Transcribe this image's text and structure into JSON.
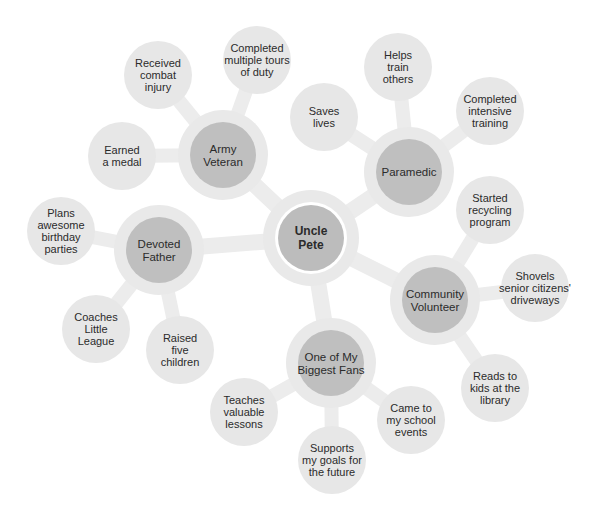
{
  "colors": {
    "connector": "#ececec",
    "halo": "#e9e9e9",
    "leaf": "#e7e7e7",
    "category": "#bfbfbf",
    "center": "#bcbcbc",
    "center_ring": "#ffffff",
    "text": "#2b2b2b"
  },
  "center": {
    "label": [
      "Uncle",
      "Pete"
    ]
  },
  "categories": [
    {
      "id": "army-veteran",
      "label": [
        "Army",
        "Veteran"
      ],
      "leaves": [
        {
          "label": [
            "Received",
            "combat",
            "injury"
          ]
        },
        {
          "label": [
            "Completed",
            "multiple tours",
            "of duty"
          ]
        },
        {
          "label": [
            "Earned",
            "a medal"
          ]
        }
      ]
    },
    {
      "id": "paramedic",
      "label": [
        "Paramedic"
      ],
      "leaves": [
        {
          "label": [
            "Saves",
            "lives"
          ]
        },
        {
          "label": [
            "Helps",
            "train",
            "others"
          ]
        },
        {
          "label": [
            "Completed",
            "intensive",
            "training"
          ]
        }
      ]
    },
    {
      "id": "community-volunteer",
      "label": [
        "Community",
        "Volunteer"
      ],
      "leaves": [
        {
          "label": [
            "Started",
            "recycling",
            "program"
          ]
        },
        {
          "label": [
            "Shovels",
            "senior citizens'",
            "driveways"
          ]
        },
        {
          "label": [
            "Reads to",
            "kids at the",
            "library"
          ]
        }
      ]
    },
    {
      "id": "biggest-fans",
      "label": [
        "One of My",
        "Biggest Fans"
      ],
      "leaves": [
        {
          "label": [
            "Teaches",
            "valuable",
            "lessons"
          ]
        },
        {
          "label": [
            "Supports",
            "my goals for",
            "the future"
          ]
        },
        {
          "label": [
            "Came to",
            "my school",
            "events"
          ]
        }
      ]
    },
    {
      "id": "devoted-father",
      "label": [
        "Devoted",
        "Father"
      ],
      "leaves": [
        {
          "label": [
            "Plans",
            "awesome",
            "birthday",
            "parties"
          ]
        },
        {
          "label": [
            "Coaches",
            "Little",
            "League"
          ]
        },
        {
          "label": [
            "Raised",
            "five",
            "children"
          ]
        }
      ]
    }
  ]
}
